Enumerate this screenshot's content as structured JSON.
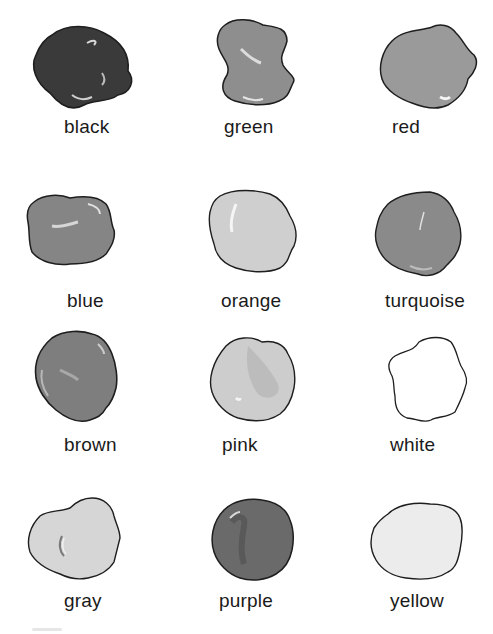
{
  "swatches": [
    {
      "label": "black",
      "fill": "#3a3a3a",
      "row": 0,
      "col": 0
    },
    {
      "label": "green",
      "fill": "#8e8e8e",
      "row": 0,
      "col": 1
    },
    {
      "label": "red",
      "fill": "#9a9a9a",
      "row": 0,
      "col": 2
    },
    {
      "label": "blue",
      "fill": "#858585",
      "row": 1,
      "col": 0
    },
    {
      "label": "orange",
      "fill": "#cfcfcf",
      "row": 1,
      "col": 1
    },
    {
      "label": "turquoise",
      "fill": "#8a8a8a",
      "row": 1,
      "col": 2
    },
    {
      "label": "brown",
      "fill": "#7e7e7e",
      "row": 2,
      "col": 0
    },
    {
      "label": "pink",
      "fill": "#cdcdcd",
      "row": 2,
      "col": 1
    },
    {
      "label": "white",
      "fill": "#ffffff",
      "row": 2,
      "col": 2
    },
    {
      "label": "gray",
      "fill": "#d6d6d6",
      "row": 3,
      "col": 0
    },
    {
      "label": "purple",
      "fill": "#6a6a6a",
      "row": 3,
      "col": 1
    },
    {
      "label": "yellow",
      "fill": "#ececec",
      "row": 3,
      "col": 2
    }
  ],
  "colors": {
    "outline": "#1e1e1e",
    "text": "#1a1a1a",
    "background": "#ffffff"
  }
}
